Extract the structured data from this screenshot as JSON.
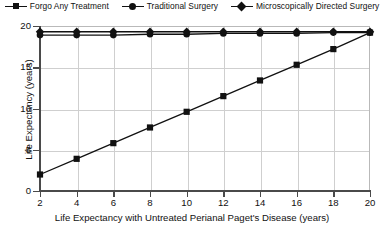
{
  "chart_data": {
    "type": "line",
    "title": "",
    "xlabel": "Life Expectancy with Untreated Perianal Paget's Disease (years)",
    "ylabel": "Life Expectancy (years)",
    "x": [
      2,
      4,
      6,
      8,
      10,
      12,
      14,
      16,
      18,
      20
    ],
    "xlim": [
      2,
      20
    ],
    "ylim": [
      0,
      20
    ],
    "xticks": [
      "2",
      "4",
      "6",
      "8",
      "10",
      "12",
      "14",
      "16",
      "18",
      "20"
    ],
    "yticks": [
      "0",
      "5",
      "10",
      "15",
      "20"
    ],
    "grid": true,
    "legend_position": "top",
    "series": [
      {
        "name": "Forgo Any Treatment",
        "marker": "square",
        "values": [
          2.0,
          3.9,
          5.8,
          7.7,
          9.6,
          11.5,
          13.4,
          15.3,
          17.2,
          19.2
        ]
      },
      {
        "name": "Traditional Surgery",
        "marker": "circle",
        "values": [
          18.9,
          18.9,
          18.9,
          19.0,
          19.0,
          19.1,
          19.1,
          19.1,
          19.2,
          19.2
        ]
      },
      {
        "name": "Microscopically Directed Surgery",
        "marker": "diamond",
        "values": [
          19.3,
          19.3,
          19.3,
          19.3,
          19.3,
          19.3,
          19.3,
          19.3,
          19.3,
          19.3
        ]
      }
    ]
  },
  "legend": {
    "items": [
      {
        "label": "Forgo Any Treatment",
        "marker": "square"
      },
      {
        "label": "Traditional Surgery",
        "marker": "circle"
      },
      {
        "label": "Microscopically Directed Surgery",
        "marker": "diamond"
      }
    ]
  },
  "colors": {
    "series_line": "#111111",
    "grid": "#cfcfcf",
    "axis": "#4a4a4a",
    "frame": "#b9b9b9",
    "background": "#ffffff"
  }
}
